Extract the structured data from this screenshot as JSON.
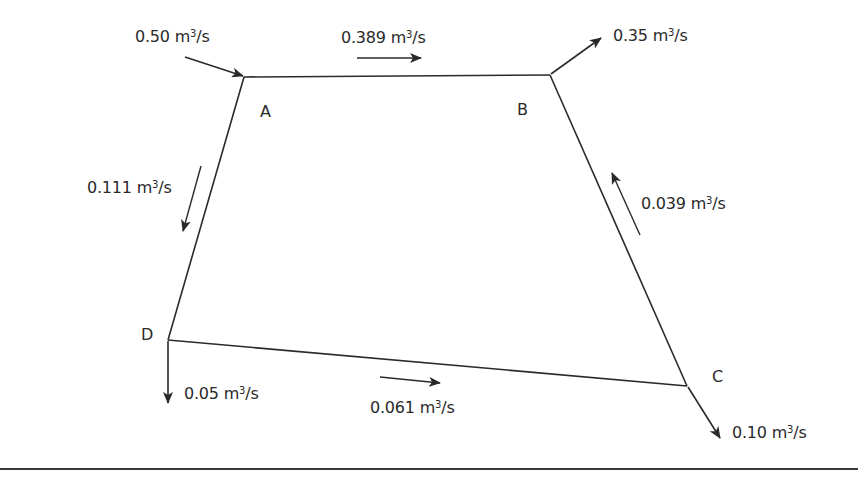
{
  "diagram": {
    "line_color": "#2a2a2a",
    "nodes": [
      {
        "id": "A",
        "label": "A"
      },
      {
        "id": "B",
        "label": "B"
      },
      {
        "id": "C",
        "label": "C"
      },
      {
        "id": "D",
        "label": "D"
      }
    ],
    "external_flows": [
      {
        "node": "A",
        "direction": "in",
        "value": "0.50",
        "unit": "m",
        "unit_exp": "3",
        "unit_tail": "/s"
      },
      {
        "node": "B",
        "direction": "out",
        "value": "0.35",
        "unit": "m",
        "unit_exp": "3",
        "unit_tail": "/s"
      },
      {
        "node": "C",
        "direction": "out",
        "value": "0.10",
        "unit": "m",
        "unit_exp": "3",
        "unit_tail": "/s"
      },
      {
        "node": "D",
        "direction": "out",
        "value": "0.05",
        "unit": "m",
        "unit_exp": "3",
        "unit_tail": "/s"
      }
    ],
    "pipe_flows": [
      {
        "pipe": "A-B",
        "direction": "A to B",
        "value": "0.389",
        "unit": "m",
        "unit_exp": "3",
        "unit_tail": "/s"
      },
      {
        "pipe": "A-D",
        "direction": "A to D",
        "value": "0.111",
        "unit": "m",
        "unit_exp": "3",
        "unit_tail": "/s"
      },
      {
        "pipe": "C-B",
        "direction": "C to B",
        "value": "0.039",
        "unit": "m",
        "unit_exp": "3",
        "unit_tail": "/s"
      },
      {
        "pipe": "D-C",
        "direction": "D to C",
        "value": "0.061",
        "unit": "m",
        "unit_exp": "3",
        "unit_tail": "/s"
      }
    ]
  }
}
